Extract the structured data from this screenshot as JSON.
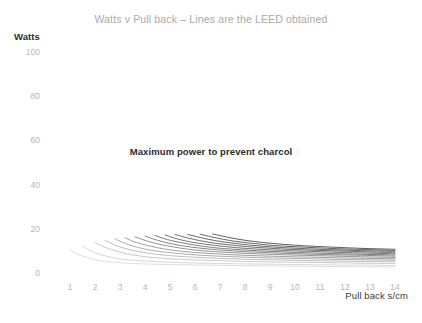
{
  "chart_data": {
    "type": "line",
    "title": "Watts v Pull back – Lines are the LEED obtained",
    "xlabel": "Pull back s/cm",
    "ylabel": "Watts",
    "xlim": [
      0,
      14.6
    ],
    "ylim": [
      0,
      100
    ],
    "xticks": [
      1,
      2,
      3,
      4,
      5,
      6,
      7,
      8,
      9,
      10,
      11,
      12,
      13,
      14
    ],
    "yticks": [
      0,
      20,
      40,
      60,
      80,
      100
    ],
    "grid": false,
    "legend": false,
    "annotations": [
      {
        "text": "Maximum power to prevent charcol",
        "x": 6.2,
        "y": 60
      }
    ],
    "series": [
      {
        "name": "LEED 1",
        "color": "#d9d9d9",
        "x": [
          1.0,
          1.3,
          1.7,
          2.1,
          2.6,
          3.2,
          4.0,
          5.0,
          6.2,
          7.5,
          9.0,
          10.5,
          12.0,
          14.0
        ],
        "y": [
          10.5,
          8.6,
          7.0,
          5.8,
          5.0,
          4.5,
          4.1,
          3.8,
          3.6,
          3.4,
          3.2,
          3.0,
          2.9,
          2.7
        ]
      },
      {
        "name": "LEED 2",
        "color": "#d2d2d2",
        "x": [
          1.5,
          1.8,
          2.2,
          2.7,
          3.2,
          3.9,
          4.7,
          5.7,
          6.9,
          8.2,
          9.6,
          11.0,
          12.5,
          14.0
        ],
        "y": [
          12.2,
          10.2,
          8.4,
          7.0,
          6.1,
          5.5,
          5.0,
          4.6,
          4.3,
          4.1,
          3.9,
          3.7,
          3.6,
          3.4
        ]
      },
      {
        "name": "LEED 3",
        "color": "#c4c4c4",
        "x": [
          2.0,
          2.4,
          2.9,
          3.4,
          4.0,
          4.7,
          5.6,
          6.6,
          7.8,
          9.1,
          10.5,
          11.8,
          13.0,
          14.0
        ],
        "y": [
          13.8,
          11.6,
          9.8,
          8.4,
          7.4,
          6.7,
          6.1,
          5.7,
          5.3,
          5.0,
          4.8,
          4.6,
          4.4,
          4.3
        ]
      },
      {
        "name": "LEED 4",
        "color": "#b5b5b5",
        "x": [
          2.4,
          2.8,
          3.3,
          3.9,
          4.5,
          5.3,
          6.2,
          7.3,
          8.5,
          9.8,
          11.1,
          12.3,
          13.3,
          14.0
        ],
        "y": [
          14.8,
          12.6,
          10.8,
          9.4,
          8.4,
          7.6,
          7.0,
          6.5,
          6.1,
          5.8,
          5.5,
          5.3,
          5.2,
          5.1
        ]
      },
      {
        "name": "LEED 5",
        "color": "#a3a3a3",
        "x": [
          2.8,
          3.2,
          3.7,
          4.3,
          5.0,
          5.8,
          6.8,
          7.9,
          9.1,
          10.4,
          11.6,
          12.7,
          13.5,
          14.0
        ],
        "y": [
          15.5,
          13.4,
          11.6,
          10.2,
          9.2,
          8.4,
          7.7,
          7.2,
          6.8,
          6.5,
          6.2,
          6.0,
          5.9,
          5.8
        ]
      },
      {
        "name": "LEED 6",
        "color": "#949494",
        "x": [
          3.2,
          3.6,
          4.2,
          4.8,
          5.5,
          6.4,
          7.4,
          8.5,
          9.7,
          10.9,
          12.0,
          13.0,
          13.6,
          14.0
        ],
        "y": [
          16.0,
          14.0,
          12.2,
          10.8,
          9.8,
          9.0,
          8.3,
          7.8,
          7.4,
          7.1,
          6.8,
          6.6,
          6.5,
          6.4
        ]
      },
      {
        "name": "LEED 7",
        "color": "#878787",
        "x": [
          3.6,
          4.1,
          4.7,
          5.4,
          6.1,
          7.0,
          8.0,
          9.1,
          10.3,
          11.4,
          12.4,
          13.2,
          13.7,
          14.0
        ],
        "y": [
          16.4,
          14.4,
          12.7,
          11.3,
          10.3,
          9.5,
          8.9,
          8.4,
          8.0,
          7.7,
          7.4,
          7.2,
          7.1,
          7.0
        ]
      },
      {
        "name": "LEED 8",
        "color": "#7a7a7a",
        "x": [
          4.0,
          4.5,
          5.1,
          5.8,
          6.6,
          7.5,
          8.5,
          9.6,
          10.7,
          11.8,
          12.7,
          13.4,
          13.8,
          14.0
        ],
        "y": [
          16.7,
          14.8,
          13.1,
          11.8,
          10.8,
          10.0,
          9.4,
          8.9,
          8.5,
          8.2,
          8.0,
          7.8,
          7.7,
          7.6
        ]
      },
      {
        "name": "LEED 9",
        "color": "#707070",
        "x": [
          4.4,
          4.9,
          5.6,
          6.3,
          7.1,
          8.0,
          9.0,
          10.1,
          11.2,
          12.2,
          13.0,
          13.6,
          13.9,
          14.0
        ],
        "y": [
          17.0,
          15.1,
          13.4,
          12.1,
          11.1,
          10.4,
          9.8,
          9.3,
          8.9,
          8.6,
          8.4,
          8.3,
          8.2,
          8.2
        ]
      },
      {
        "name": "LEED 10",
        "color": "#666666",
        "x": [
          4.8,
          5.3,
          6.0,
          6.8,
          7.6,
          8.5,
          9.5,
          10.6,
          11.6,
          12.5,
          13.2,
          13.7,
          13.9,
          14.0
        ],
        "y": [
          17.2,
          15.4,
          13.7,
          12.5,
          11.5,
          10.8,
          10.2,
          9.8,
          9.4,
          9.1,
          8.9,
          8.8,
          8.7,
          8.7
        ]
      },
      {
        "name": "LEED 11",
        "color": "#5e5e5e",
        "x": [
          5.2,
          5.8,
          6.5,
          7.3,
          8.1,
          9.0,
          10.0,
          11.0,
          11.9,
          12.8,
          13.4,
          13.8,
          13.95,
          14.0
        ],
        "y": [
          17.4,
          15.6,
          14.0,
          12.8,
          11.9,
          11.2,
          10.6,
          10.2,
          9.9,
          9.6,
          9.4,
          9.3,
          9.2,
          9.2
        ]
      },
      {
        "name": "LEED 12",
        "color": "#585858",
        "x": [
          5.7,
          6.3,
          7.0,
          7.8,
          8.6,
          9.5,
          10.4,
          11.3,
          12.2,
          13.0,
          13.5,
          13.9,
          14.0,
          14.0
        ],
        "y": [
          17.5,
          15.8,
          14.3,
          13.1,
          12.2,
          11.5,
          11.0,
          10.6,
          10.3,
          10.0,
          9.9,
          9.8,
          9.7,
          9.7
        ]
      },
      {
        "name": "LEED 13",
        "color": "#525252",
        "x": [
          6.2,
          6.8,
          7.5,
          8.3,
          9.1,
          10.0,
          10.9,
          11.7,
          12.5,
          13.2,
          13.7,
          13.95,
          14.0,
          14.0
        ],
        "y": [
          17.6,
          16.0,
          14.5,
          13.4,
          12.5,
          11.9,
          11.4,
          11.0,
          10.7,
          10.5,
          10.3,
          10.2,
          10.2,
          10.2
        ]
      },
      {
        "name": "LEED 14",
        "color": "#4d4d4d",
        "x": [
          6.7,
          7.3,
          8.0,
          8.8,
          9.6,
          10.4,
          11.3,
          12.1,
          12.8,
          13.4,
          13.8,
          14.0,
          14.0,
          14.0
        ],
        "y": [
          17.7,
          16.2,
          14.8,
          13.7,
          12.9,
          12.3,
          11.8,
          11.4,
          11.1,
          10.9,
          10.8,
          10.7,
          10.7,
          10.7
        ]
      }
    ]
  }
}
